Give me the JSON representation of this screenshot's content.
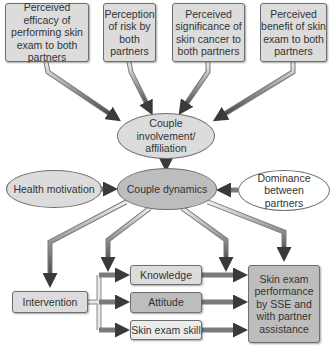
{
  "diagram": {
    "title": "",
    "perceptions": [
      {
        "label": "Perceived efficacy of performing skin exam to both partners"
      },
      {
        "label": "Perception of risk by both partners"
      },
      {
        "label": "Perceived significance of skin cancer to both partners"
      },
      {
        "label": "Perceived benefit of skin exam to both partners"
      }
    ],
    "involvement": {
      "label": "Couple involvement/ affiliation"
    },
    "dynamics": {
      "label": "Couple dynamics"
    },
    "health_motivation": {
      "label": "Health motivation"
    },
    "dominance": {
      "label": "Dominance between partners"
    },
    "intervention": {
      "label": "Intervention"
    },
    "mediators": [
      {
        "label": "Knowledge"
      },
      {
        "label": "Attitude"
      },
      {
        "label": "Skin exam skill"
      }
    ],
    "outcome": {
      "label": "Skin exam performance by SSE and with partner assistance"
    },
    "edges": [
      {
        "from": "Perceived efficacy of performing skin exam to both partners",
        "to": "Couple involvement/ affiliation"
      },
      {
        "from": "Perception of risk by both partners",
        "to": "Couple involvement/ affiliation"
      },
      {
        "from": "Perceived significance of skin cancer to both partners",
        "to": "Couple involvement/ affiliation"
      },
      {
        "from": "Perceived benefit of skin exam to both partners",
        "to": "Couple involvement/ affiliation"
      },
      {
        "from": "Couple involvement/ affiliation",
        "to": "Couple dynamics"
      },
      {
        "from": "Health motivation",
        "to": "Couple dynamics"
      },
      {
        "from": "Dominance between partners",
        "to": "Couple dynamics"
      },
      {
        "from": "Couple dynamics",
        "to": "Intervention"
      },
      {
        "from": "Couple dynamics",
        "to": "Knowledge"
      },
      {
        "from": "Couple dynamics",
        "to": "Skin exam performance"
      },
      {
        "from": "Couple dynamics",
        "to": "Skin exam performance"
      },
      {
        "from": "Intervention",
        "to": "Knowledge"
      },
      {
        "from": "Intervention",
        "to": "Attitude"
      },
      {
        "from": "Intervention",
        "to": "Skin exam skill"
      },
      {
        "from": "Knowledge",
        "to": "Skin exam performance"
      },
      {
        "from": "Attitude",
        "to": "Skin exam performance"
      },
      {
        "from": "Skin exam skill",
        "to": "Skin exam performance"
      }
    ],
    "colors": {
      "light_node": "#dcdcdc",
      "mid_node": "#bdbdbd",
      "pale_node": "#ececec",
      "arrow_dark": "#4a4a4a",
      "arrow_light": "#e6e6e6"
    }
  }
}
